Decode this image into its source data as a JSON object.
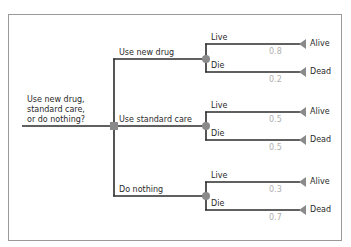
{
  "diagram": {
    "type": "decision-tree",
    "question": [
      "Use new drug,",
      "standard care,",
      "or do nothing?"
    ],
    "options": [
      {
        "label": "Use new drug",
        "outcomes": [
          {
            "branch": "Live",
            "probability": "0.8",
            "end": "Alive"
          },
          {
            "branch": "Die",
            "probability": "0.2",
            "end": "Dead"
          }
        ]
      },
      {
        "label": "Use standard care",
        "outcomes": [
          {
            "branch": "Live",
            "probability": "0.5",
            "end": "Alive"
          },
          {
            "branch": "Die",
            "probability": "0.5",
            "end": "Dead"
          }
        ]
      },
      {
        "label": "Do nothing",
        "outcomes": [
          {
            "branch": "Live",
            "probability": "0.3",
            "end": "Alive"
          },
          {
            "branch": "Die",
            "probability": "0.7",
            "end": "Dead"
          }
        ]
      }
    ],
    "colors": {
      "line": "#2b2b2b",
      "node": "#8a8a8a",
      "frame": "#9a9a9a",
      "probability_text": "#b0b0b0"
    }
  }
}
